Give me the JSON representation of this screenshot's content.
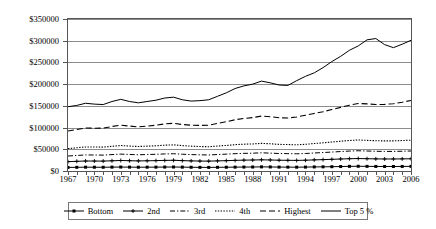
{
  "chart_data": {
    "type": "line",
    "title": "",
    "xlabel": "",
    "ylabel": "",
    "xlim": [
      1967,
      2006
    ],
    "ylim": [
      0,
      350000
    ],
    "grid": true,
    "legend_position": "bottom",
    "y_ticks": [
      0,
      50000,
      100000,
      150000,
      200000,
      250000,
      300000,
      350000
    ],
    "y_tick_labels": [
      "$0",
      "$50000",
      "$100000",
      "$150000",
      "$200000",
      "$250000",
      "$300000",
      "$350000"
    ],
    "x_ticks": [
      1967,
      1970,
      1973,
      1976,
      1979,
      1982,
      1985,
      1988,
      1991,
      1994,
      1997,
      2000,
      2003,
      2006
    ],
    "x_tick_labels": [
      "1967",
      "1970",
      "1973",
      "1976",
      "1979",
      "1982",
      "1985",
      "1988",
      "1991",
      "1994",
      "1997",
      "2000",
      "2003",
      "2006"
    ],
    "x": [
      1967,
      1968,
      1969,
      1970,
      1971,
      1972,
      1973,
      1974,
      1975,
      1976,
      1977,
      1978,
      1979,
      1980,
      1981,
      1982,
      1983,
      1984,
      1985,
      1986,
      1987,
      1988,
      1989,
      1990,
      1991,
      1992,
      1993,
      1994,
      1995,
      1996,
      1997,
      1998,
      1999,
      2000,
      2001,
      2002,
      2003,
      2004,
      2005,
      2006
    ],
    "series": [
      {
        "name": "Bottom",
        "style": "solid-square-marker",
        "values": [
          8200,
          8500,
          8800,
          8700,
          8600,
          8900,
          9100,
          8900,
          8700,
          8800,
          8900,
          9100,
          9200,
          8900,
          8600,
          8400,
          8300,
          8500,
          8700,
          8900,
          9100,
          9200,
          9500,
          9300,
          9000,
          8900,
          8800,
          9000,
          9400,
          9600,
          9900,
          10300,
          10700,
          10900,
          10700,
          10500,
          10400,
          10400,
          10500,
          10700
        ]
      },
      {
        "name": "2nd",
        "style": "solid-plus-marker",
        "values": [
          21500,
          22300,
          23000,
          22900,
          22800,
          23500,
          24200,
          23700,
          23200,
          23500,
          23900,
          24400,
          24700,
          23900,
          23300,
          22900,
          22700,
          23300,
          23800,
          24500,
          25000,
          25300,
          25800,
          25400,
          24800,
          24600,
          24400,
          24800,
          25600,
          26200,
          26900,
          27600,
          28300,
          28700,
          28300,
          27900,
          27700,
          27700,
          27900,
          28200
        ]
      },
      {
        "name": "3rd",
        "style": "dash-dot",
        "values": [
          34500,
          35800,
          37000,
          36800,
          36600,
          37800,
          38900,
          38100,
          37400,
          37900,
          38500,
          39300,
          39800,
          38600,
          37800,
          37200,
          36900,
          37900,
          38800,
          39900,
          40600,
          41000,
          41900,
          41200,
          40300,
          40000,
          39600,
          40300,
          41500,
          42500,
          43600,
          44800,
          45900,
          46600,
          46000,
          45400,
          45100,
          45100,
          45500,
          46000
        ]
      },
      {
        "name": "4th",
        "style": "dotted",
        "values": [
          51500,
          53500,
          55400,
          55200,
          55000,
          56900,
          58600,
          57400,
          56400,
          57200,
          58100,
          59400,
          60200,
          58400,
          57200,
          56300,
          55900,
          57400,
          58900,
          60600,
          61700,
          62300,
          63700,
          62700,
          61300,
          60900,
          60400,
          61400,
          63300,
          64900,
          66700,
          68500,
          70300,
          71400,
          70500,
          69700,
          69300,
          69400,
          70100,
          71000
        ]
      },
      {
        "name": "Highest",
        "style": "dashed",
        "values": [
          92000,
          95500,
          99000,
          98500,
          98700,
          102500,
          105500,
          103500,
          101500,
          103500,
          105500,
          108500,
          110000,
          107000,
          105500,
          105000,
          105500,
          109500,
          113500,
          118000,
          121000,
          123000,
          126500,
          125000,
          122500,
          122000,
          124500,
          128500,
          132500,
          136500,
          141500,
          146500,
          151500,
          155500,
          154500,
          153000,
          153500,
          155000,
          158500,
          162500
        ]
      },
      {
        "name": "Top 5 %",
        "style": "solid",
        "values": [
          148000,
          151000,
          156000,
          154000,
          153000,
          160000,
          165000,
          160000,
          157000,
          160000,
          163000,
          168000,
          170000,
          164000,
          161000,
          162000,
          164000,
          172000,
          180000,
          190000,
          196000,
          200000,
          207000,
          203000,
          198000,
          197000,
          208000,
          218000,
          226000,
          238000,
          252000,
          264000,
          278000,
          288000,
          302000,
          305000,
          291000,
          284000,
          292000,
          301000
        ]
      }
    ]
  },
  "legend": {
    "items": [
      {
        "label": "Bottom"
      },
      {
        "label": "2nd"
      },
      {
        "label": "3rd"
      },
      {
        "label": "4th"
      },
      {
        "label": "Highest"
      },
      {
        "label": "Top 5 %"
      }
    ]
  }
}
